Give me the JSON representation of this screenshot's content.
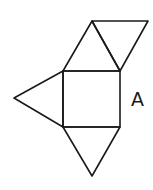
{
  "diagram": {
    "type": "net",
    "stroke_color": "#1a1a1a",
    "background": "#ffffff",
    "points": {
      "sq_tl": [
        63,
        71
      ],
      "sq_tr": [
        120,
        71
      ],
      "sq_br": [
        120,
        127
      ],
      "sq_bl": [
        63,
        127
      ],
      "top_apex": [
        92,
        21
      ],
      "top_right": [
        148,
        21
      ],
      "left_apex": [
        14,
        98
      ],
      "bottom_apex": [
        92,
        176
      ]
    },
    "shapes": [
      {
        "name": "square-base",
        "type": "square",
        "points": [
          "sq_tl",
          "sq_tr",
          "sq_br",
          "sq_bl"
        ]
      },
      {
        "name": "top-triangle",
        "type": "triangle",
        "points": [
          "sq_tl",
          "top_apex",
          "sq_tr"
        ]
      },
      {
        "name": "top-right-triangle",
        "type": "triangle",
        "points": [
          "top_apex",
          "top_right",
          "sq_tr"
        ]
      },
      {
        "name": "left-triangle",
        "type": "triangle",
        "points": [
          "sq_tl",
          "left_apex",
          "sq_bl"
        ]
      },
      {
        "name": "bottom-triangle",
        "type": "triangle",
        "points": [
          "sq_bl",
          "bottom_apex",
          "sq_br"
        ]
      }
    ],
    "labels": [
      {
        "name": "label-a",
        "text": "A",
        "x": 131,
        "y": 106
      }
    ]
  }
}
